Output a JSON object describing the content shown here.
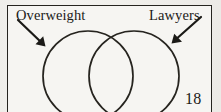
{
  "figure": {
    "kind": "venn-diagram",
    "labels": {
      "left": "Overweight",
      "right": "Lawyers"
    },
    "page_number": "18",
    "colors": {
      "ink": "#1b1a17",
      "stroke": "#26241f",
      "paper": "#f4f3f0",
      "frame_fill": "#f6f5f2"
    },
    "geometry": {
      "frame": {
        "x": 7,
        "y": 5,
        "width": 205,
        "height": 112
      },
      "circle_left": {
        "cx": 88,
        "cy": 76,
        "r": 45
      },
      "circle_right": {
        "cx": 134,
        "cy": 76,
        "r": 45
      },
      "arrow_left": {
        "x1": 18,
        "y1": 20,
        "x2": 45,
        "y2": 46
      },
      "arrow_right": {
        "x1": 201,
        "y1": 17,
        "x2": 172,
        "y2": 43
      }
    }
  }
}
